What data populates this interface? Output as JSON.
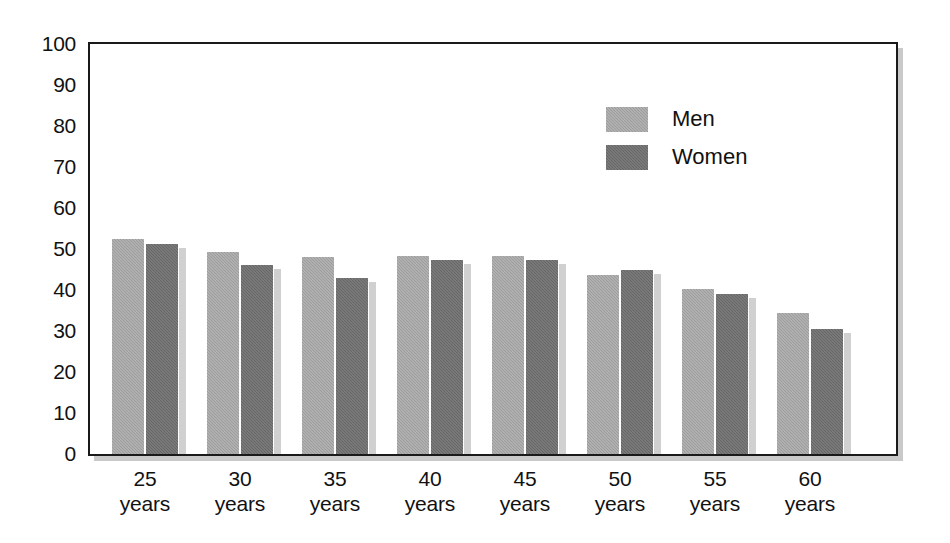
{
  "chart_data": {
    "type": "bar",
    "title": "",
    "subtitle": "",
    "xlabel": "",
    "ylabel": "",
    "categories": [
      "25 years",
      "30 years",
      "35 years",
      "40 years",
      "45 years",
      "50 years",
      "55 years",
      "60 years"
    ],
    "category_numbers": [
      "25",
      "30",
      "35",
      "40",
      "45",
      "50",
      "55",
      "60"
    ],
    "category_unit": "years",
    "series": [
      {
        "name": "Men",
        "color": "#9c9c9c",
        "values": [
          52.5,
          49.3,
          48.0,
          48.3,
          48.2,
          43.7,
          40.3,
          34.5
        ]
      },
      {
        "name": "Women",
        "color": "#666666",
        "values": [
          51.3,
          46.0,
          43.0,
          47.3,
          47.2,
          45.0,
          39.1,
          30.5
        ]
      }
    ],
    "ylim": [
      0,
      100
    ],
    "ytick_values": [
      0,
      10,
      20,
      30,
      40,
      50,
      60,
      70,
      80,
      90,
      100
    ],
    "ytick_labels": [
      "0",
      "10",
      "20",
      "30",
      "40",
      "50",
      "60",
      "70",
      "80",
      "90",
      "100"
    ],
    "grid": false,
    "legend_position": "inside-upper-right",
    "frame": true,
    "annotations": []
  },
  "legend": {
    "entries": [
      {
        "label": "Men"
      },
      {
        "label": "Women"
      }
    ]
  }
}
